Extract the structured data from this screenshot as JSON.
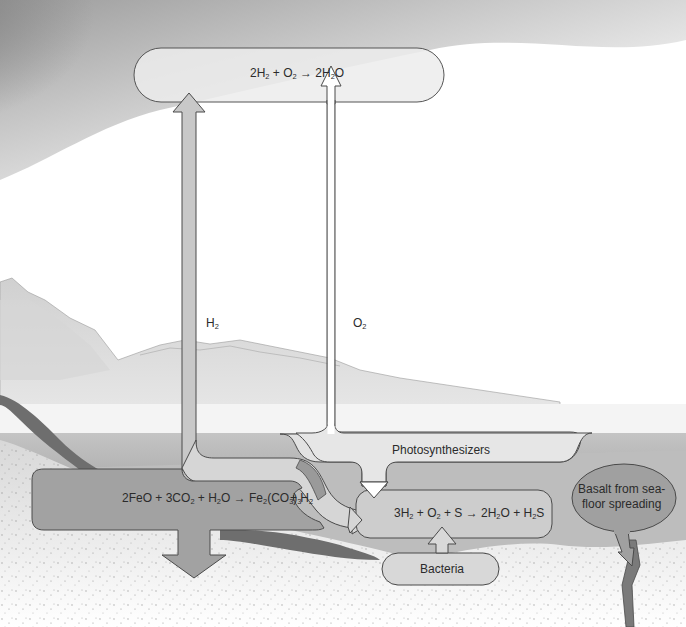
{
  "diagram": {
    "nodes": {
      "top_reaction": {
        "label": "2H₂ + O₂ → 2H₂O",
        "parts": [
          "2H",
          "2",
          " + O",
          "2",
          " → 2H",
          "2",
          "O"
        ]
      },
      "iron_reaction": {
        "label": "2FeO + 3CO₂ + H₂O → Fe₂(CO₃)₃",
        "parts": [
          "2FeO + 3CO",
          "2",
          " + H",
          "2",
          "O → Fe",
          "2",
          "(CO",
          "3",
          ")",
          "3"
        ]
      },
      "h2_byproduct": {
        "label": "+ H₂",
        "parts": [
          "+ H",
          "2"
        ]
      },
      "sulfur_reaction": {
        "label": "3H₂ + O₂ + S → 2H₂O + H₂S",
        "parts": [
          "3H",
          "2",
          " + O",
          "2",
          " + S → 2H",
          "2",
          "O + H",
          "2",
          "S"
        ]
      },
      "photosynthesizers": {
        "label": "Photosynthesizers"
      },
      "bacteria": {
        "label": "Bacteria"
      },
      "basalt": {
        "label_line1": "Basalt from sea-",
        "label_line2": "floor spreading"
      }
    },
    "edges": [
      {
        "from": "iron_reaction",
        "to": "top_reaction",
        "label": "H₂",
        "label_parts": [
          "H",
          "2"
        ]
      },
      {
        "from": "photosynthesizers",
        "to": "top_reaction",
        "label": "O₂",
        "label_parts": [
          "O",
          "2"
        ]
      },
      {
        "from": "iron_reaction",
        "to": "sulfur_reaction",
        "label": "H₂"
      },
      {
        "from": "photosynthesizers",
        "to": "sulfur_reaction",
        "label": ""
      },
      {
        "from": "bacteria",
        "to": "sulfur_reaction",
        "label": ""
      },
      {
        "from": "basalt",
        "to": "seafloor",
        "label": ""
      },
      {
        "from": "iron_reaction",
        "to": "sediment",
        "label": ""
      }
    ],
    "colors": {
      "sky_cloud": "#9a9a9a",
      "box_light": "#e4e4e4",
      "box_mid": "#cfcfcf",
      "iron_box": "#9c9c9c",
      "dark_accent": "#7e7e7e",
      "sea": "#b9b9b9",
      "stroke": "#4a4a4a",
      "text": "#2b2b2b"
    }
  }
}
